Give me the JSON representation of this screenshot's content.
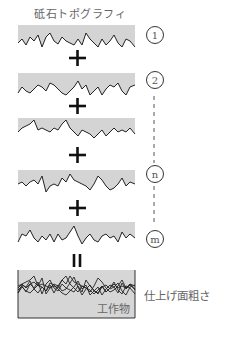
{
  "title": "砥石トポグラフィ",
  "bands": [
    {
      "id": "1",
      "top": 25,
      "points": [
        0,
        18,
        4,
        14,
        8,
        20,
        12,
        12,
        16,
        16,
        20,
        10,
        24,
        22,
        28,
        12,
        32,
        8,
        36,
        16,
        40,
        19,
        44,
        12,
        48,
        16,
        52,
        18,
        56,
        20,
        60,
        14,
        64,
        20,
        68,
        8,
        72,
        14,
        76,
        18,
        80,
        22,
        84,
        14,
        88,
        20,
        92,
        16,
        96,
        10,
        100,
        18,
        104,
        22,
        108,
        14,
        112,
        16,
        117,
        22
      ]
    },
    {
      "id": "2",
      "top": 73,
      "points": [
        0,
        20,
        4,
        14,
        8,
        18,
        12,
        20,
        16,
        16,
        20,
        12,
        24,
        14,
        28,
        18,
        32,
        10,
        36,
        12,
        40,
        16,
        44,
        20,
        48,
        22,
        52,
        18,
        56,
        14,
        60,
        8,
        64,
        16,
        68,
        12,
        72,
        22,
        76,
        18,
        80,
        14,
        84,
        22,
        88,
        16,
        92,
        12,
        96,
        14,
        100,
        10,
        104,
        18,
        108,
        22,
        112,
        14,
        117,
        12
      ]
    },
    {
      "id": "gap",
      "top": 118,
      "points": [
        0,
        14,
        4,
        10,
        8,
        8,
        12,
        6,
        16,
        2,
        20,
        12,
        24,
        10,
        28,
        12,
        32,
        14,
        36,
        10,
        40,
        12,
        44,
        6,
        48,
        2,
        52,
        10,
        56,
        14,
        60,
        18,
        64,
        12,
        68,
        14,
        72,
        16,
        76,
        20,
        80,
        16,
        84,
        12,
        88,
        18,
        92,
        14,
        96,
        10,
        100,
        14,
        104,
        12,
        108,
        14,
        112,
        10,
        117,
        16
      ]
    },
    {
      "id": "n",
      "top": 170,
      "points": [
        0,
        14,
        4,
        12,
        8,
        16,
        12,
        12,
        16,
        10,
        20,
        14,
        24,
        6,
        28,
        22,
        32,
        16,
        36,
        14,
        40,
        16,
        44,
        8,
        48,
        12,
        52,
        4,
        56,
        10,
        60,
        12,
        64,
        14,
        68,
        16,
        72,
        20,
        76,
        14,
        80,
        6,
        84,
        10,
        88,
        16,
        92,
        20,
        96,
        18,
        100,
        14,
        104,
        8,
        108,
        16,
        112,
        12,
        117,
        14
      ]
    },
    {
      "id": "m",
      "top": 222,
      "points": [
        0,
        20,
        4,
        12,
        8,
        14,
        12,
        8,
        16,
        16,
        20,
        20,
        24,
        14,
        28,
        18,
        32,
        12,
        36,
        20,
        40,
        12,
        44,
        18,
        48,
        16,
        52,
        10,
        56,
        4,
        60,
        14,
        64,
        22,
        68,
        16,
        72,
        12,
        76,
        18,
        80,
        20,
        84,
        14,
        88,
        12,
        92,
        16,
        96,
        14,
        100,
        20,
        104,
        10,
        108,
        16,
        112,
        12,
        117,
        16
      ]
    }
  ],
  "circle_labels": [
    {
      "text": "1",
      "cx": 155,
      "cy": 35
    },
    {
      "text": "2",
      "cx": 155,
      "cy": 80
    },
    {
      "text": "n",
      "cx": 155,
      "cy": 174
    },
    {
      "text": "m",
      "cx": 155,
      "cy": 239
    }
  ],
  "operators": {
    "plus": "+",
    "equals": "="
  },
  "result_box": {
    "label": "工作物"
  },
  "result_label": "仕上げ面粗さ",
  "colors": {
    "band_fill": "#d4d4d4",
    "line": "#222222",
    "box_fill": "#d6d6d6"
  }
}
